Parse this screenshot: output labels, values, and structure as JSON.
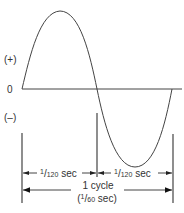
{
  "diagram": {
    "y_labels": {
      "positive": "(+)",
      "zero": "0",
      "negative": "(–)"
    },
    "half_cycles": [
      {
        "numerator": "1",
        "denominator": "120",
        "unit": "sec"
      },
      {
        "numerator": "1",
        "denominator": "120",
        "unit": "sec"
      }
    ],
    "full_cycle": {
      "label": "1 cycle",
      "open_paren": "(",
      "numerator": "1",
      "denominator": "60",
      "unit": "sec)"
    },
    "colors": {
      "line": "#444444",
      "text": "#333333",
      "background": "#ffffff"
    }
  }
}
